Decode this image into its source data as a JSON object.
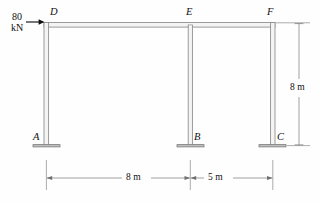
{
  "diagram": {
    "type": "structural-frame",
    "load": {
      "magnitude": "80",
      "unit": "kN",
      "direction": "right",
      "applied_at": "D"
    },
    "joints": {
      "top_left": "D",
      "top_middle": "E",
      "top_right": "F",
      "base_left": "A",
      "base_middle": "B",
      "base_right": "C"
    },
    "dimensions": {
      "height": "8 m",
      "bay_left": "8 m",
      "bay_right": "5 m"
    },
    "colors": {
      "member": "#8d8d8d",
      "member_fill": "#f2f2f2",
      "dimension": "#6f6f6f",
      "text": "#101010"
    }
  }
}
